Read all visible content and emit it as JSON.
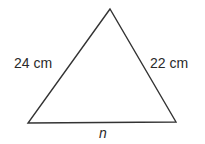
{
  "diagram": {
    "type": "triangle",
    "vertices": {
      "apex": [
        110,
        9
      ],
      "bottom_left": [
        28,
        123
      ],
      "bottom_right": [
        176,
        122
      ]
    },
    "stroke_color": "#333333",
    "labels": {
      "left_side": "24 cm",
      "right_side": "22 cm",
      "base": "n"
    }
  }
}
